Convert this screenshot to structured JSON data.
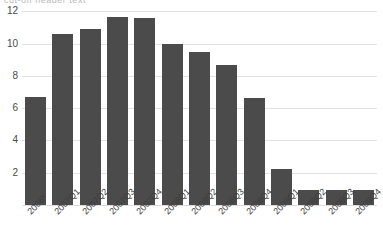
{
  "title_sliver": "cut-off header text",
  "colors": {
    "bar": "#4b4b4b",
    "gridline": "#e2e2e2",
    "background": "#ffffff",
    "tick_text": "#4a4a4a"
  },
  "chart_data": {
    "type": "bar",
    "title": "",
    "xlabel": "",
    "ylabel": "",
    "ylim": [
      0,
      12.8
    ],
    "yticks": [
      2,
      4,
      6,
      8,
      10,
      12
    ],
    "ytick_labels": [
      "2",
      "4",
      "6",
      "8",
      "10",
      "12"
    ],
    "grid": true,
    "legend": "none",
    "categories": [
      "2006*",
      "2007Q1",
      "2007Q2",
      "2007Q3",
      "2007Q4",
      "2008Q1",
      "2008Q2",
      "2008Q3",
      "2008Q4",
      "2009Q1",
      "2009Q2",
      "2009Q3",
      "2009Q4"
    ],
    "values": [
      6.7,
      10.6,
      10.9,
      11.65,
      11.55,
      10.0,
      9.5,
      8.7,
      6.6,
      2.2,
      0.9,
      0.95,
      0.9
    ]
  }
}
